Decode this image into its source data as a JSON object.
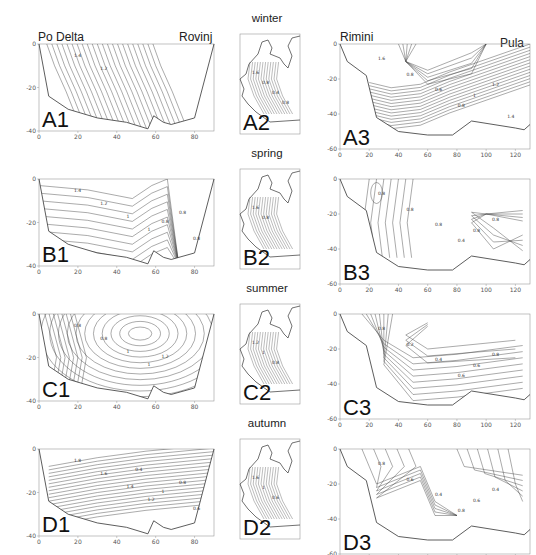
{
  "figure": {
    "top_cut_text": "(cut-off caption text)",
    "seasons": [
      "winter",
      "spring",
      "summer",
      "autumn"
    ],
    "section_left": {
      "start_station": "Po Delta",
      "end_station": "Rovinj",
      "xlim": [
        0,
        90
      ],
      "ylim": [
        -40,
        0
      ],
      "xticks": [
        "0",
        "20",
        "40",
        "60",
        "80"
      ],
      "yticks": [
        "0",
        "-20",
        "-40"
      ]
    },
    "section_right": {
      "start_station": "Rimini",
      "end_station": "Pula",
      "xlim": [
        0,
        130
      ],
      "ylim": [
        -60,
        0
      ],
      "xticks": [
        "0",
        "20",
        "40",
        "60",
        "80",
        "100",
        "120"
      ],
      "yticks": [
        "0",
        "-20",
        "-40",
        "-60"
      ]
    },
    "panels": [
      {
        "id": "A1",
        "season": "winter",
        "type": "section-left",
        "contour_labels": [
          "1.4",
          "1.2"
        ]
      },
      {
        "id": "A2",
        "season": "winter",
        "type": "map",
        "contour_labels": [
          "1.6",
          "0.8",
          "0.4",
          "0.8"
        ]
      },
      {
        "id": "A3",
        "season": "winter",
        "type": "section-right",
        "contour_labels": [
          "1.6",
          "0.8",
          "0.6",
          "0.8",
          "1",
          "1.2",
          "1.4"
        ]
      },
      {
        "id": "B1",
        "season": "spring",
        "type": "section-left",
        "contour_labels": [
          "1.4",
          "1.2",
          "1",
          "1",
          "0.8",
          "0.8",
          "0.8"
        ]
      },
      {
        "id": "B2",
        "season": "spring",
        "type": "map",
        "contour_labels": [
          "1.6",
          "0.8"
        ]
      },
      {
        "id": "B3",
        "season": "spring",
        "type": "section-right",
        "contour_labels": [
          "0.8",
          "0.8",
          "0.8",
          "0.4",
          "0.8",
          "0.8"
        ]
      },
      {
        "id": "C1",
        "season": "summer",
        "type": "section-left",
        "contour_labels": [
          "0.8",
          "0.8",
          "1",
          "1",
          "1.2"
        ]
      },
      {
        "id": "C2",
        "season": "summer",
        "type": "map",
        "contour_labels": [
          "1.2",
          "1",
          "0.8"
        ]
      },
      {
        "id": "C3",
        "season": "summer",
        "type": "section-right",
        "contour_labels": [
          "0.8",
          "0.2",
          "0.4",
          "0.6",
          "0.6",
          "0.8"
        ]
      },
      {
        "id": "D1",
        "season": "autumn",
        "type": "section-left",
        "contour_labels": [
          "1.8",
          "1.6",
          "1.4",
          "1.2",
          "1",
          "0.8",
          "0.6",
          "0.4"
        ]
      },
      {
        "id": "D2",
        "season": "autumn",
        "type": "map",
        "contour_labels": [
          "1.6",
          "1",
          "0.6"
        ]
      },
      {
        "id": "D3",
        "season": "autumn",
        "type": "section-right",
        "contour_labels": [
          "0.8",
          "0.6",
          "0.4",
          "0.8",
          "0.6",
          "0.4"
        ]
      }
    ]
  }
}
